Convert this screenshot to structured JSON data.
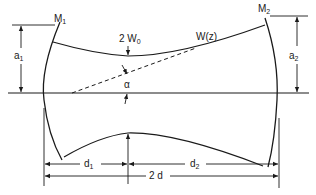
{
  "diagram": {
    "labels": {
      "mirror1": {
        "main": "M",
        "sub": "1"
      },
      "mirror2": {
        "main": "M",
        "sub": "2"
      },
      "aperture1": {
        "main": "a",
        "sub": "1"
      },
      "aperture2": {
        "main": "a",
        "sub": "2"
      },
      "waist": {
        "main": "2 W",
        "sub": "0"
      },
      "beam_radius": "W(z)",
      "angle": "α",
      "distance1": {
        "main": "d",
        "sub": "1"
      },
      "distance2": {
        "main": "d",
        "sub": "2"
      },
      "total_length": "2 d"
    },
    "colors": {
      "ink": "#1a1a1a",
      "background": "#ffffff"
    }
  }
}
